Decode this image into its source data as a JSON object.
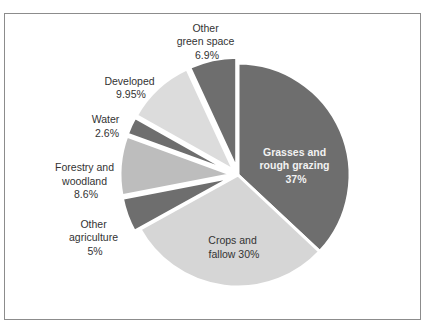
{
  "chart_data": {
    "type": "pie",
    "title": "",
    "start_angle_deg": 0,
    "direction": "clockwise",
    "slices": [
      {
        "name": "Grasses and rough grazing",
        "value": 37,
        "label_lines": [
          "Grasses and",
          "rough grazing",
          "37%"
        ],
        "color": "#6e6e6e",
        "exploded": false,
        "label_inside": true
      },
      {
        "name": "Crops and fallow",
        "value": 30,
        "label_lines": [
          "Crops and",
          "fallow 30%"
        ],
        "color": "#d6d6d6",
        "exploded": false,
        "label_inside": true
      },
      {
        "name": "Other agriculture",
        "value": 5,
        "label_lines": [
          "Other",
          "agriculture",
          "5%"
        ],
        "color": "#6e6e6e",
        "exploded": true,
        "label_inside": false
      },
      {
        "name": "Forestry and woodland",
        "value": 8.6,
        "label_lines": [
          "Forestry and",
          "woodland",
          "8.6%"
        ],
        "color": "#bdbdbd",
        "exploded": true,
        "label_inside": false
      },
      {
        "name": "Water",
        "value": 2.6,
        "label_lines": [
          "Water",
          "2.6%"
        ],
        "color": "#6e6e6e",
        "exploded": true,
        "label_inside": false
      },
      {
        "name": "Developed",
        "value": 9.95,
        "label_lines": [
          "Developed",
          "9.95%"
        ],
        "color": "#dcdcdc",
        "exploded": true,
        "label_inside": false
      },
      {
        "name": "Other green space",
        "value": 6.9,
        "label_lines": [
          "Other",
          "green space",
          "6.9%"
        ],
        "color": "#6e6e6e",
        "exploded": true,
        "label_inside": false
      }
    ],
    "legend": "none",
    "units": "%"
  },
  "labels": {
    "grasses": [
      "Grasses and",
      "rough grazing",
      "37%"
    ],
    "crops": [
      "Crops and",
      "fallow 30%"
    ],
    "other_agriculture": [
      "Other",
      "agriculture",
      "5%"
    ],
    "forestry": [
      "Forestry and",
      "woodland",
      "8.6%"
    ],
    "water": [
      "Water",
      "2.6%"
    ],
    "developed": [
      "Developed",
      "9.95%"
    ],
    "other_green": [
      "Other",
      "green space",
      "6.9%"
    ]
  }
}
